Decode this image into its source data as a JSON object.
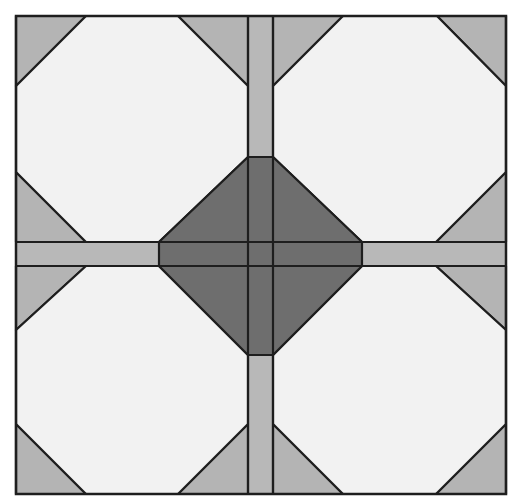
{
  "diagram": {
    "title": "",
    "colors": {
      "background": "#ffffff",
      "octagon": "#f2f2f2",
      "corner_triangle": "#b4b4b4",
      "sashing": "#b8b8b8",
      "center_diamond": "#6e6e6e",
      "stroke": "#1e1e1e"
    },
    "bounds": {
      "x0": 16,
      "y0": 16,
      "x1": 506,
      "y1": 494
    },
    "sashing": {
      "vertical": {
        "x0": 248,
        "x1": 273
      },
      "horizontal": {
        "y0": 242,
        "y1": 266
      }
    },
    "center_diamond": {
      "top": [
        248,
        157,
        273,
        157
      ],
      "right": [
        362,
        242,
        362,
        266
      ],
      "bottom": [
        248,
        355,
        273,
        355
      ],
      "left": [
        159,
        242,
        159,
        266
      ]
    },
    "octagons": [
      {
        "name": "top-left",
        "points": "86,16 178,16 248,86 248,157 159,242 86,242 16,172 16,86"
      },
      {
        "name": "top-right",
        "points": "273,86 343,16 437,16 506,86 506,172 436,242 362,242 273,157"
      },
      {
        "name": "bottom-left",
        "points": "16,330 86,266 159,266 248,355 248,424 178,494 86,494 16,424"
      },
      {
        "name": "bottom-right",
        "points": "273,355 362,266 436,266 506,330 506,424 436,494 343,494 273,424"
      }
    ],
    "corner_triangles": [
      {
        "name": "tl-tl",
        "points": "16,16 86,16 16,86"
      },
      {
        "name": "tl-tr",
        "points": "178,16 248,16 248,86"
      },
      {
        "name": "tl-bl",
        "points": "16,172 86,242 16,242"
      },
      {
        "name": "tr-tl",
        "points": "273,16 343,16 273,86"
      },
      {
        "name": "tr-tr",
        "points": "437,16 506,16 506,86"
      },
      {
        "name": "tr-br",
        "points": "506,172 506,242 436,242"
      },
      {
        "name": "bl-tl",
        "points": "16,266 86,266 16,330"
      },
      {
        "name": "bl-bl",
        "points": "16,424 86,494 16,494"
      },
      {
        "name": "bl-br",
        "points": "248,424 248,494 178,494"
      },
      {
        "name": "br-tr",
        "points": "436,266 506,266 506,330"
      },
      {
        "name": "br-bl",
        "points": "273,424 343,494 273,494"
      },
      {
        "name": "br-br",
        "points": "506,424 506,494 436,494"
      }
    ],
    "diamond_quadrants": [
      {
        "name": "diamond-tl",
        "points": "248,157 248,242 159,242"
      },
      {
        "name": "diamond-tr",
        "points": "273,157 362,242 273,242"
      },
      {
        "name": "diamond-bl",
        "points": "159,266 248,266 248,355"
      },
      {
        "name": "diamond-br",
        "points": "273,266 362,266 273,355"
      }
    ]
  }
}
